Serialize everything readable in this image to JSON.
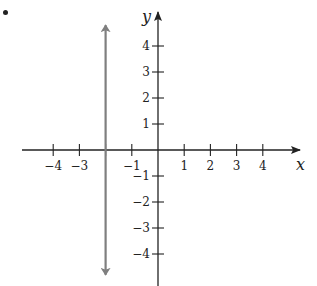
{
  "chart_data": {
    "type": "line",
    "title": "",
    "xlabel": "x",
    "ylabel": "y",
    "xlim": [
      -5,
      5
    ],
    "ylim": [
      -5,
      5
    ],
    "grid": false,
    "x_ticks": [
      -4,
      -3,
      -1,
      1,
      2,
      3,
      4
    ],
    "x_tick_labels": [
      "−4",
      "−3",
      "−1",
      "1",
      "2",
      "3",
      "4"
    ],
    "x_tick_marks": [
      -4,
      -3,
      -2,
      -1,
      1,
      2,
      3,
      4
    ],
    "y_ticks": [
      4,
      3,
      2,
      1,
      -1,
      -2,
      -3,
      -4
    ],
    "y_tick_labels": [
      "4",
      "3",
      "2",
      "1",
      "−1",
      "−2",
      "−3",
      "−4"
    ],
    "series": [
      {
        "name": "x = -2",
        "kind": "vertical-line",
        "x": [
          -2,
          -2
        ],
        "y": [
          -4.8,
          4.8
        ],
        "arrows": "both",
        "color": "#7f7f7f"
      }
    ],
    "axis_color": "#222222"
  },
  "labels": {
    "x_axis": "x",
    "y_axis": "y"
  }
}
